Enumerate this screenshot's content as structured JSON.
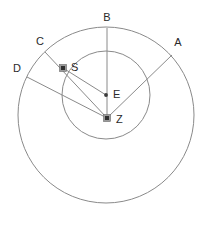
{
  "diagram": {
    "canvas": {
      "width": 213,
      "height": 225
    },
    "colors": {
      "background": "#ffffff",
      "stroke": "#8a8a8a",
      "label": "#2a2a2a",
      "marker": "#2f2f2f",
      "marker_ring": "#9a9a9a"
    },
    "circles": [
      {
        "name": "outer-circle",
        "cx": 106,
        "cy": 115,
        "r": 88
      },
      {
        "name": "inner-circle",
        "cx": 106,
        "cy": 95,
        "r": 44
      }
    ],
    "points": [
      {
        "id": "A",
        "label": "A",
        "marker": "none",
        "x": 172,
        "y": 55,
        "label_x": 178,
        "label_y": 43
      },
      {
        "id": "B",
        "label": "B",
        "marker": "none",
        "x": 107,
        "y": 28,
        "label_x": 107,
        "label_y": 18
      },
      {
        "id": "C",
        "label": "C",
        "marker": "none",
        "x": 45,
        "y": 52,
        "label_x": 40,
        "label_y": 42
      },
      {
        "id": "D",
        "label": "D",
        "marker": "none",
        "x": 27,
        "y": 77,
        "label_x": 17,
        "label_y": 69
      },
      {
        "id": "S",
        "label": "S",
        "marker": "square",
        "x": 63,
        "y": 68,
        "label_x": 71,
        "label_y": 68
      },
      {
        "id": "E",
        "label": "E",
        "marker": "dot",
        "x": 106,
        "y": 95,
        "label_x": 113,
        "label_y": 95
      },
      {
        "id": "Z",
        "label": "Z",
        "marker": "square",
        "x": 107,
        "y": 118,
        "label_x": 116,
        "label_y": 120
      }
    ],
    "rays": [
      {
        "name": "ray-z-to-a",
        "from": "Z",
        "to": "A"
      },
      {
        "name": "ray-z-to-b",
        "from": "Z",
        "to": "B"
      },
      {
        "name": "ray-z-to-c",
        "from": "Z",
        "to": "C"
      },
      {
        "name": "ray-z-to-d",
        "from": "Z",
        "to": "D"
      },
      {
        "name": "ray-s-to-e",
        "from": "S",
        "to": "E"
      }
    ]
  }
}
